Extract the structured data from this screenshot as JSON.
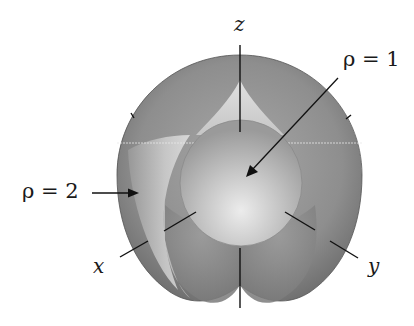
{
  "figure": {
    "type": "spherical-coordinates-diagram",
    "labels": {
      "z_axis": "z",
      "x_axis": "x",
      "y_axis": "y",
      "inner_sphere": "ρ = 1",
      "outer_sphere": "ρ = 2"
    },
    "colors": {
      "background": "#ffffff",
      "outer_sphere": "#8a8a8a",
      "outer_sphere_light": "#c8c8c8",
      "inner_sphere": "#b4b4b4",
      "inner_sphere_highlight": "#e6e6e6",
      "cone_region": "#d2d2d2",
      "axis": "#111111"
    }
  }
}
